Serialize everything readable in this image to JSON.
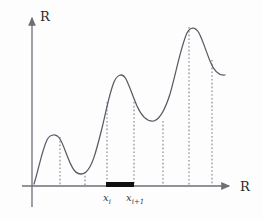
{
  "figure": {
    "title": "",
    "background_color": "#fdfdfd",
    "curve_color": "#5a5a66",
    "axis_color": "#6e6e78",
    "dash_color": "#808088",
    "interval_bar_color": "#101010",
    "axes": {
      "y_label": "R",
      "x_label": "R",
      "origin": {
        "x": 32,
        "y": 186
      },
      "x_axis_end": {
        "x": 233,
        "y": 186
      },
      "y_axis_top": {
        "x": 32,
        "y": 14
      }
    },
    "interval": {
      "left_label": "x",
      "left_sub": "i",
      "right_label": "x",
      "right_sub": "i+1",
      "bar_x_start": 106,
      "bar_x_end": 134,
      "bar_y": 184,
      "bar_thickness": 5
    },
    "dashed_lines": [
      {
        "name": "drop-line-1",
        "x": 60,
        "y_top": 137
      },
      {
        "name": "drop-line-2",
        "x": 85,
        "y_top": 172
      },
      {
        "name": "drop-line-3",
        "x": 107,
        "y_top": 102
      },
      {
        "name": "drop-line-4",
        "x": 134,
        "y_top": 102
      },
      {
        "name": "drop-line-5",
        "x": 163,
        "y_top": 121
      },
      {
        "name": "drop-line-6",
        "x": 189,
        "y_top": 27
      },
      {
        "name": "drop-line-7",
        "x": 212,
        "y_top": 60
      }
    ],
    "curve_path": "M 34 184 C 38 172, 42 150, 47 140 C 50 134, 56 133, 60 139 C 65 147, 68 162, 74 170 C 78 175, 82 175, 86 172 C 92 167, 96 152, 101 132 C 105 117, 109 94, 114 82 C 117 75, 122 72, 126 79 C 130 87, 133 97, 137 106 C 142 117, 148 122, 154 121 C 160 119, 165 110, 170 94 C 176 73, 181 46, 187 33 C 190 27, 195 26, 199 33 C 203 41, 206 51, 210 61 C 214 71, 219 76, 225 75"
  },
  "chart_data": {
    "type": "line",
    "title": "",
    "xlabel": "R",
    "ylabel": "R",
    "legend": [],
    "grid": false,
    "x": [
      0,
      8,
      15,
      22,
      28,
      34,
      42,
      50,
      58,
      66,
      75,
      82,
      90,
      98,
      105,
      112,
      120,
      128,
      135,
      143,
      150,
      158,
      166,
      174,
      182,
      190,
      196
    ],
    "y": [
      2,
      14,
      30,
      42,
      46,
      42,
      32,
      22,
      16,
      18,
      30,
      48,
      70,
      86,
      92,
      86,
      74,
      66,
      64,
      70,
      86,
      104,
      120,
      128,
      120,
      104,
      92
    ],
    "annotations": [
      {
        "label": "x_i",
        "x_pixel": 107,
        "note": "left endpoint of highlighted interval"
      },
      {
        "label": "x_{i+1}",
        "x_pixel": 134,
        "note": "right endpoint of highlighted interval"
      }
    ],
    "features": {
      "local_maxima_pixels": [
        [
          52,
          137
        ],
        [
          120,
          73
        ],
        [
          190,
          26
        ]
      ],
      "local_minima_pixels": [
        [
          30,
          184
        ],
        [
          80,
          174
        ],
        [
          155,
          121
        ]
      ],
      "partition_points_pixels": [
        60,
        85,
        107,
        134,
        163,
        189,
        212
      ],
      "highlighted_subinterval_pixels": [
        107,
        134
      ]
    }
  }
}
